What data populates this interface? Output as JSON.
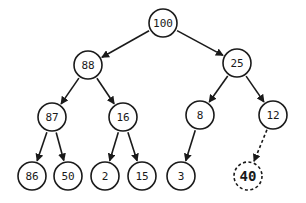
{
  "diagram": {
    "type": "binary-max-heap-insertion",
    "nodes": [
      {
        "id": "n100",
        "label": "100",
        "x": 163,
        "y": 23,
        "style": "solid"
      },
      {
        "id": "n88",
        "label": "88",
        "x": 88,
        "y": 65,
        "style": "solid"
      },
      {
        "id": "n25",
        "label": "25",
        "x": 237,
        "y": 63,
        "style": "solid"
      },
      {
        "id": "n87",
        "label": "87",
        "x": 52,
        "y": 117,
        "style": "solid"
      },
      {
        "id": "n16",
        "label": "16",
        "x": 123,
        "y": 117,
        "style": "solid"
      },
      {
        "id": "n8",
        "label": "8",
        "x": 200,
        "y": 115,
        "style": "solid"
      },
      {
        "id": "n12",
        "label": "12",
        "x": 273,
        "y": 115,
        "style": "solid"
      },
      {
        "id": "n86",
        "label": "86",
        "x": 32,
        "y": 176,
        "style": "solid"
      },
      {
        "id": "n50",
        "label": "50",
        "x": 68,
        "y": 176,
        "style": "solid"
      },
      {
        "id": "n2",
        "label": "2",
        "x": 105,
        "y": 176,
        "style": "solid"
      },
      {
        "id": "n15",
        "label": "15",
        "x": 142,
        "y": 176,
        "style": "solid"
      },
      {
        "id": "n3",
        "label": "3",
        "x": 181,
        "y": 176,
        "style": "solid"
      },
      {
        "id": "n40",
        "label": "40",
        "x": 248,
        "y": 176,
        "style": "dashed"
      }
    ],
    "edges": [
      {
        "from": "n100",
        "to": "n88",
        "style": "solid"
      },
      {
        "from": "n100",
        "to": "n25",
        "style": "solid"
      },
      {
        "from": "n88",
        "to": "n87",
        "style": "solid"
      },
      {
        "from": "n88",
        "to": "n16",
        "style": "solid"
      },
      {
        "from": "n25",
        "to": "n8",
        "style": "solid"
      },
      {
        "from": "n25",
        "to": "n12",
        "style": "solid"
      },
      {
        "from": "n87",
        "to": "n86",
        "style": "solid"
      },
      {
        "from": "n87",
        "to": "n50",
        "style": "solid"
      },
      {
        "from": "n16",
        "to": "n2",
        "style": "solid"
      },
      {
        "from": "n16",
        "to": "n15",
        "style": "solid"
      },
      {
        "from": "n8",
        "to": "n3",
        "style": "solid"
      },
      {
        "from": "n12",
        "to": "n40",
        "style": "dashed"
      }
    ],
    "node_radius": 14,
    "colors": {
      "stroke": "#1a1a1a",
      "fill": "#ffffff",
      "background": "#ffffff"
    }
  }
}
